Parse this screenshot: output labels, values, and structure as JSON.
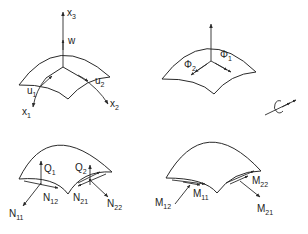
{
  "figure": {
    "colors": {
      "line": "#2a2a2a",
      "text": "#222222",
      "background": "#ffffff"
    }
  },
  "panels": [
    {
      "id": "coordinates-displacements",
      "labels": {
        "x3": {
          "base": "x",
          "sub": "3"
        },
        "w": {
          "base": "w",
          "sub": ""
        },
        "u1": {
          "base": "u",
          "sub": "1"
        },
        "u2": {
          "base": "u",
          "sub": "2"
        },
        "x1": {
          "base": "x",
          "sub": "1"
        },
        "x2": {
          "base": "x",
          "sub": "2"
        }
      }
    },
    {
      "id": "rotations",
      "labels": {
        "phi1": {
          "base": "Φ",
          "sub": "1"
        },
        "phi2": {
          "base": "Φ",
          "sub": "2"
        }
      },
      "legend_icon": "rotation-double-arrow-icon"
    },
    {
      "id": "membrane-shear-forces",
      "labels": {
        "Q1": {
          "base": "Q",
          "sub": "1"
        },
        "Q2": {
          "base": "Q",
          "sub": "2"
        },
        "N11": {
          "base": "N",
          "sub": "11"
        },
        "N12": {
          "base": "N",
          "sub": "12"
        },
        "N21": {
          "base": "N",
          "sub": "21"
        },
        "N22": {
          "base": "N",
          "sub": "22"
        }
      }
    },
    {
      "id": "moments",
      "labels": {
        "M11": {
          "base": "M",
          "sub": "11"
        },
        "M12": {
          "base": "M",
          "sub": "12"
        },
        "M21": {
          "base": "M",
          "sub": "21"
        },
        "M22": {
          "base": "M",
          "sub": "22"
        }
      }
    }
  ]
}
